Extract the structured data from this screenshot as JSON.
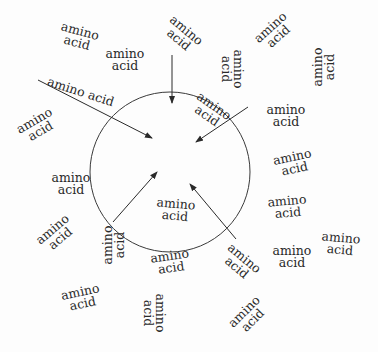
{
  "diagram": {
    "circle": {
      "cx": 170,
      "cy": 172,
      "r": 80,
      "stroke": "#3a3a3a"
    },
    "arrows": [
      {
        "name": "arrow-top",
        "x1": 172,
        "y1": 55,
        "x2": 172,
        "y2": 103
      },
      {
        "name": "arrow-upper-left",
        "x1": 38,
        "y1": 80,
        "x2": 152,
        "y2": 138
      },
      {
        "name": "arrow-upper-right",
        "x1": 248,
        "y1": 107,
        "x2": 196,
        "y2": 142
      },
      {
        "name": "arrow-lower-left",
        "x1": 113,
        "y1": 222,
        "x2": 157,
        "y2": 172
      },
      {
        "name": "arrow-lower-right",
        "x1": 236,
        "y1": 239,
        "x2": 190,
        "y2": 184
      }
    ],
    "labels": [
      {
        "id": "aa1",
        "line1": "amino",
        "line2": "acid",
        "x": 78,
        "y": 37,
        "rot": 15
      },
      {
        "id": "aa2",
        "line1": "amino",
        "line2": "acid",
        "x": 125,
        "y": 60,
        "rot": 0
      },
      {
        "id": "aa3",
        "text": "amino acid",
        "x": 80,
        "y": 92,
        "rot": 18,
        "single": true
      },
      {
        "id": "aa4",
        "line1": "amino",
        "line2": "acid",
        "x": 37,
        "y": 126,
        "rot": -30
      },
      {
        "id": "aa5",
        "line1": "amino",
        "line2": "acid",
        "x": 71,
        "y": 184,
        "rot": 0
      },
      {
        "id": "aa6",
        "line1": "amino",
        "line2": "acid",
        "x": 182,
        "y": 35,
        "rot": 40
      },
      {
        "id": "aa7",
        "line1": "amino",
        "line2": "acid",
        "x": 232,
        "y": 69,
        "rot": 90
      },
      {
        "id": "aa8",
        "line1": "amino",
        "line2": "acid",
        "x": 274,
        "y": 32,
        "rot": -42
      },
      {
        "id": "aa9",
        "line1": "amino",
        "line2": "acid",
        "x": 324,
        "y": 67,
        "rot": -90
      },
      {
        "id": "aa10",
        "line1": "amino",
        "line2": "acid",
        "x": 210,
        "y": 111,
        "rot": 35
      },
      {
        "id": "aa11",
        "line1": "amino",
        "line2": "acid",
        "x": 286,
        "y": 116,
        "rot": 0
      },
      {
        "id": "aa12",
        "line1": "amino",
        "line2": "acid",
        "x": 293,
        "y": 163,
        "rot": -12
      },
      {
        "id": "aa13",
        "line1": "amino",
        "line2": "acid",
        "x": 287,
        "y": 207,
        "rot": -5
      },
      {
        "id": "aa14",
        "line1": "amino",
        "line2": "acid",
        "x": 56,
        "y": 234,
        "rot": -40
      },
      {
        "id": "aa15",
        "line1": "amino",
        "line2": "acid",
        "x": 114,
        "y": 245,
        "rot": -90
      },
      {
        "id": "aa16",
        "line1": "amino",
        "line2": "acid",
        "x": 175,
        "y": 210,
        "rot": 5
      },
      {
        "id": "aa17",
        "line1": "amino",
        "line2": "acid",
        "x": 170,
        "y": 262,
        "rot": -8
      },
      {
        "id": "aa18",
        "line1": "amino",
        "line2": "acid",
        "x": 81,
        "y": 298,
        "rot": -12
      },
      {
        "id": "aa19",
        "line1": "amino",
        "line2": "acid",
        "x": 154,
        "y": 313,
        "rot": 90
      },
      {
        "id": "aa20",
        "line1": "amino",
        "line2": "acid",
        "x": 240,
        "y": 263,
        "rot": 40
      },
      {
        "id": "aa21",
        "line1": "amino",
        "line2": "acid",
        "x": 248,
        "y": 316,
        "rot": -45
      },
      {
        "id": "aa22",
        "line1": "amino",
        "line2": "acid",
        "x": 292,
        "y": 257,
        "rot": 0
      },
      {
        "id": "aa23",
        "line1": "amino",
        "line2": "acid",
        "x": 340,
        "y": 244,
        "rot": 5
      }
    ]
  }
}
